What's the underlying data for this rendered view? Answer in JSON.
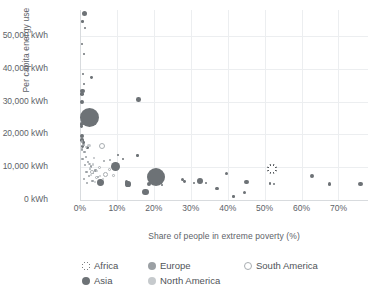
{
  "chart_data": {
    "type": "scatter",
    "title": "",
    "xlabel": "Share of people in extreme poverty (%)",
    "ylabel": "Per capita energy use",
    "xlim": [
      0,
      78
    ],
    "ylim": [
      0,
      58000
    ],
    "grid": true,
    "legend_position": "bottom",
    "xticks": [
      "0%",
      "10%",
      "20%",
      "30%",
      "40%",
      "50%",
      "60%",
      "70%"
    ],
    "xtick_values": [
      0,
      10,
      20,
      30,
      40,
      50,
      60,
      70
    ],
    "yticks": [
      "0 kWh",
      "10,000 kWh",
      "20,000 kWh",
      "30,000 kWh",
      "40,000 kWh",
      "50,000 kWh"
    ],
    "ytick_values": [
      0,
      10000,
      20000,
      30000,
      40000,
      50000
    ],
    "size_encoding": "population",
    "series": [
      {
        "name": "Africa",
        "color": "#55595d",
        "marker": "asterisk-in-circle",
        "points": [
          {
            "x": 52.0,
            "y": 9500,
            "r": 5.0
          },
          {
            "x": 2.2,
            "y": 24800,
            "r": 3.0
          }
        ]
      },
      {
        "name": "Asia",
        "color": "#6d7276",
        "marker": "filled-circle",
        "points": [
          {
            "x": 1.2,
            "y": 57000,
            "r": 2.6
          },
          {
            "x": 0.6,
            "y": 54500,
            "r": 1.3
          },
          {
            "x": 1.4,
            "y": 52500,
            "r": 1.1
          },
          {
            "x": 0.5,
            "y": 47500,
            "r": 1.0
          },
          {
            "x": 1.1,
            "y": 44500,
            "r": 1.1
          },
          {
            "x": 0.8,
            "y": 38500,
            "r": 1.0
          },
          {
            "x": 3.2,
            "y": 37500,
            "r": 1.4
          },
          {
            "x": 1.0,
            "y": 35500,
            "r": 1.1
          },
          {
            "x": 0.7,
            "y": 33200,
            "r": 2.1
          },
          {
            "x": 0.6,
            "y": 32400,
            "r": 1.8
          },
          {
            "x": 0.5,
            "y": 30000,
            "r": 1.9
          },
          {
            "x": 15.8,
            "y": 30600,
            "r": 2.3
          },
          {
            "x": 2.6,
            "y": 25200,
            "r": 9.5
          },
          {
            "x": 0.4,
            "y": 23200,
            "r": 1.6
          },
          {
            "x": 0.5,
            "y": 22400,
            "r": 1.4
          },
          {
            "x": 0.6,
            "y": 19500,
            "r": 1.9
          },
          {
            "x": 0.5,
            "y": 18300,
            "r": 1.7
          },
          {
            "x": 1.0,
            "y": 17600,
            "r": 1.3
          },
          {
            "x": 0.6,
            "y": 16400,
            "r": 1.4
          },
          {
            "x": 2.0,
            "y": 16000,
            "r": 1.2
          },
          {
            "x": 9.6,
            "y": 10200,
            "r": 4.4
          },
          {
            "x": 5.5,
            "y": 5400,
            "r": 3.4
          },
          {
            "x": 20.5,
            "y": 7100,
            "r": 9.0
          },
          {
            "x": 17.8,
            "y": 2400,
            "r": 3.3
          },
          {
            "x": 13.0,
            "y": 4900,
            "r": 2.6
          },
          {
            "x": 12.6,
            "y": 5500,
            "r": 1.8
          },
          {
            "x": 18.6,
            "y": 4900,
            "r": 1.9
          },
          {
            "x": 32.5,
            "y": 5700,
            "r": 2.9
          },
          {
            "x": 27.8,
            "y": 6300,
            "r": 1.5
          },
          {
            "x": 28.4,
            "y": 5700,
            "r": 1.4
          },
          {
            "x": 37.0,
            "y": 3500,
            "r": 1.9
          },
          {
            "x": 39.8,
            "y": 8200,
            "r": 1.5
          },
          {
            "x": 45.0,
            "y": 5500,
            "r": 2.4
          },
          {
            "x": 44.6,
            "y": 2200,
            "r": 1.6
          },
          {
            "x": 41.5,
            "y": 1100,
            "r": 1.3
          },
          {
            "x": 51.5,
            "y": 5100,
            "r": 1.3
          },
          {
            "x": 52.5,
            "y": 4900,
            "r": 1.2
          },
          {
            "x": 62.8,
            "y": 7400,
            "r": 1.9
          },
          {
            "x": 67.5,
            "y": 4900,
            "r": 1.6
          },
          {
            "x": 76.0,
            "y": 4800,
            "r": 2.2
          },
          {
            "x": 10.4,
            "y": 13800,
            "r": 1.1
          },
          {
            "x": 11.6,
            "y": 12600,
            "r": 1.0
          },
          {
            "x": 15.6,
            "y": 13600,
            "r": 1.2
          },
          {
            "x": 20.8,
            "y": 5200,
            "r": 1.1
          },
          {
            "x": 22.2,
            "y": 4600,
            "r": 1.0
          },
          {
            "x": 31.0,
            "y": 5300,
            "r": 1.0
          },
          {
            "x": 34.0,
            "y": 5200,
            "r": 1.0
          }
        ]
      },
      {
        "name": "Europe",
        "color": "#9ba0a4",
        "marker": "filled-circle",
        "points": [
          {
            "x": 0.5,
            "y": 17900,
            "r": 1.3
          },
          {
            "x": 1.0,
            "y": 16800,
            "r": 1.2
          },
          {
            "x": 0.6,
            "y": 15400,
            "r": 1.1
          },
          {
            "x": 1.2,
            "y": 14600,
            "r": 1.1
          },
          {
            "x": 1.6,
            "y": 13200,
            "r": 1.0
          },
          {
            "x": 0.7,
            "y": 12400,
            "r": 1.1
          },
          {
            "x": 2.2,
            "y": 11600,
            "r": 1.0
          },
          {
            "x": 1.4,
            "y": 10600,
            "r": 1.2
          },
          {
            "x": 3.0,
            "y": 10200,
            "r": 1.3
          },
          {
            "x": 2.6,
            "y": 9400,
            "r": 1.0
          },
          {
            "x": 4.2,
            "y": 9000,
            "r": 1.1
          },
          {
            "x": 1.8,
            "y": 8600,
            "r": 1.2
          },
          {
            "x": 3.6,
            "y": 8100,
            "r": 1.0
          },
          {
            "x": 2.4,
            "y": 7400,
            "r": 1.1
          },
          {
            "x": 5.0,
            "y": 7000,
            "r": 1.0
          },
          {
            "x": 1.2,
            "y": 6400,
            "r": 1.0
          },
          {
            "x": 3.4,
            "y": 5900,
            "r": 1.1
          },
          {
            "x": 2.0,
            "y": 5200,
            "r": 1.0
          },
          {
            "x": 6.6,
            "y": 11800,
            "r": 1.0
          },
          {
            "x": 8.2,
            "y": 12200,
            "r": 1.0
          }
        ]
      },
      {
        "name": "North America",
        "color": "#c6cacd",
        "marker": "filled-circle",
        "points": [
          {
            "x": 2.4,
            "y": 16600,
            "r": 1.7
          },
          {
            "x": 1.6,
            "y": 16200,
            "r": 1.2
          },
          {
            "x": 3.6,
            "y": 10800,
            "r": 1.2
          },
          {
            "x": 2.8,
            "y": 9600,
            "r": 1.1
          },
          {
            "x": 4.6,
            "y": 8800,
            "r": 1.0
          },
          {
            "x": 3.0,
            "y": 7600,
            "r": 1.2
          },
          {
            "x": 5.4,
            "y": 7200,
            "r": 1.0
          },
          {
            "x": 6.2,
            "y": 6400,
            "r": 1.0
          },
          {
            "x": 4.0,
            "y": 5600,
            "r": 1.1
          }
        ]
      },
      {
        "name": "South America",
        "color": "#ffffff",
        "marker": "open-circle",
        "points": [
          {
            "x": 6.0,
            "y": 16400,
            "r": 3.2
          },
          {
            "x": 3.8,
            "y": 12800,
            "r": 1.4
          },
          {
            "x": 5.2,
            "y": 9800,
            "r": 1.6
          },
          {
            "x": 3.2,
            "y": 8600,
            "r": 1.8
          },
          {
            "x": 6.8,
            "y": 7800,
            "r": 2.4
          },
          {
            "x": 4.4,
            "y": 7000,
            "r": 1.5
          },
          {
            "x": 8.0,
            "y": 9200,
            "r": 1.4
          },
          {
            "x": 2.6,
            "y": 11000,
            "r": 1.2
          },
          {
            "x": 9.0,
            "y": 7400,
            "r": 1.3
          }
        ]
      }
    ]
  },
  "legend": {
    "items": [
      {
        "label": "Africa",
        "key": "africa"
      },
      {
        "label": "Asia",
        "key": "asia"
      },
      {
        "label": "Europe",
        "key": "europe"
      },
      {
        "label": "North America",
        "key": "northamerica"
      },
      {
        "label": "South America",
        "key": "southamerica"
      }
    ]
  }
}
